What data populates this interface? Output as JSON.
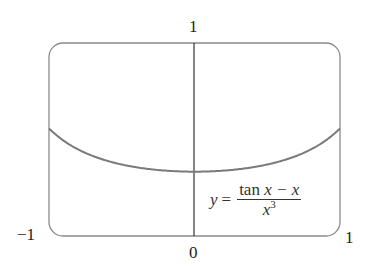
{
  "chart_data": {
    "type": "line",
    "title": "",
    "formula": {
      "lhs": "y",
      "eq": "=",
      "numerator_func": "tan",
      "numerator_rest": " x − x",
      "denominator_base": "x",
      "denominator_exp": "3"
    },
    "function": "(tan x − x) / x^3",
    "xlabel": "",
    "ylabel": "",
    "xlim": [
      -1,
      1
    ],
    "ylim": [
      0,
      1
    ],
    "grid": false,
    "tick_labels": {
      "x_left": "−1",
      "x_right": "1",
      "x_center": "0",
      "y_top": "1"
    },
    "x": [
      -1.0,
      -0.75,
      -0.5,
      -0.25,
      0.0,
      0.25,
      0.5,
      0.75,
      1.0
    ],
    "values": [
      0.557,
      0.436,
      0.37,
      0.341,
      0.333,
      0.341,
      0.37,
      0.436,
      0.557
    ],
    "colors": {
      "curve": "#7a7a7a",
      "frame": "#8a8a8a",
      "axis": "#333333"
    }
  }
}
